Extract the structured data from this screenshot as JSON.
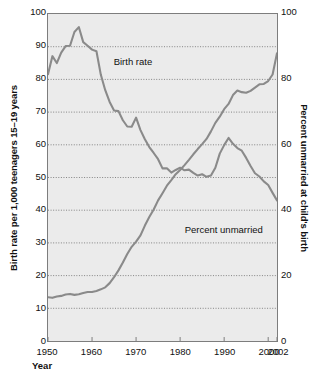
{
  "chart_data": {
    "type": "line",
    "title": "",
    "xlabel": "Year",
    "ylabel": "Birth rate per 1,000 teenagers 15–19 years",
    "y2label": "Percent unmarried at child's birth",
    "xlim": [
      1950,
      2002
    ],
    "ylim": [
      0,
      100
    ],
    "y2lim": [
      0,
      100
    ],
    "grid": true,
    "legend_position": "inline-annotation",
    "xticks": [
      1950,
      1960,
      1970,
      1980,
      1990,
      2000,
      2002
    ],
    "xticklabels": [
      "1950",
      "1960",
      "1970",
      "1980",
      "1990",
      "2000",
      "2002"
    ],
    "yticks": [
      0,
      10,
      20,
      30,
      40,
      50,
      60,
      70,
      80,
      90,
      100
    ],
    "yticklabels": [
      "0",
      "10",
      "20",
      "30",
      "40",
      "50",
      "60",
      "70",
      "80",
      "90",
      "100"
    ],
    "y2ticks": [
      0,
      10,
      20,
      30,
      40,
      50,
      60,
      70,
      80,
      90,
      100
    ],
    "y2ticklabels": [
      "0",
      "",
      "20",
      "",
      "40",
      "",
      "60",
      "",
      "80",
      "",
      "100"
    ],
    "series": [
      {
        "name": "Birth rate",
        "axis": "left",
        "color": "#8a8a8a",
        "label_x": 1965,
        "label_y": 85,
        "x": [
          1950,
          1951,
          1952,
          1953,
          1954,
          1955,
          1956,
          1957,
          1958,
          1959,
          1960,
          1961,
          1962,
          1963,
          1964,
          1965,
          1966,
          1967,
          1968,
          1969,
          1970,
          1971,
          1972,
          1973,
          1974,
          1975,
          1976,
          1977,
          1978,
          1979,
          1980,
          1981,
          1982,
          1983,
          1984,
          1985,
          1986,
          1987,
          1988,
          1989,
          1990,
          1991,
          1992,
          1993,
          1994,
          1995,
          1996,
          1997,
          1998,
          1999,
          2000,
          2001,
          2002
        ],
        "values": [
          81.6,
          87.1,
          85.0,
          88.2,
          90.2,
          90.3,
          94.5,
          96.0,
          91.4,
          90.3,
          89.1,
          88.6,
          81.4,
          76.7,
          73.1,
          70.5,
          70.3,
          67.5,
          65.6,
          65.5,
          68.3,
          64.5,
          61.7,
          59.3,
          57.5,
          55.6,
          52.8,
          52.8,
          51.5,
          52.3,
          53.0,
          52.2,
          52.4,
          51.4,
          50.6,
          51.0,
          50.2,
          50.6,
          53.0,
          57.3,
          59.9,
          62.1,
          60.3,
          59.0,
          58.2,
          56.0,
          53.5,
          51.3,
          50.3,
          48.8,
          47.7,
          45.3,
          43.0
        ]
      },
      {
        "name": "Percent unmarried",
        "axis": "right",
        "color": "#8a8a8a",
        "label_x": 1981,
        "label_y": 34,
        "x": [
          1950,
          1951,
          1952,
          1953,
          1954,
          1955,
          1956,
          1957,
          1958,
          1959,
          1960,
          1961,
          1962,
          1963,
          1964,
          1965,
          1966,
          1967,
          1968,
          1969,
          1970,
          1971,
          1972,
          1973,
          1974,
          1975,
          1976,
          1977,
          1978,
          1979,
          1980,
          1981,
          1982,
          1983,
          1984,
          1985,
          1986,
          1987,
          1988,
          1989,
          1990,
          1991,
          1992,
          1993,
          1994,
          1995,
          1996,
          1997,
          1998,
          1999,
          2000,
          2001,
          2002
        ],
        "values": [
          13.4,
          13.2,
          13.6,
          13.8,
          14.2,
          14.4,
          14.1,
          14.3,
          14.7,
          15.0,
          15.0,
          15.3,
          15.8,
          16.4,
          17.7,
          19.5,
          21.6,
          24.0,
          26.6,
          28.8,
          30.4,
          32.3,
          35.3,
          37.9,
          40.2,
          43.0,
          45.2,
          47.5,
          49.2,
          51.0,
          52.3,
          53.8,
          55.4,
          57.1,
          58.7,
          60.2,
          61.8,
          64.1,
          66.7,
          68.6,
          70.9,
          72.5,
          75.2,
          76.6,
          76.1,
          75.9,
          76.5,
          77.5,
          78.5,
          78.6,
          79.5,
          81.5,
          88.0
        ]
      }
    ]
  },
  "annotations": {
    "birth_rate_label": "Birth rate",
    "percent_unmarried_label": "Percent unmarried"
  }
}
